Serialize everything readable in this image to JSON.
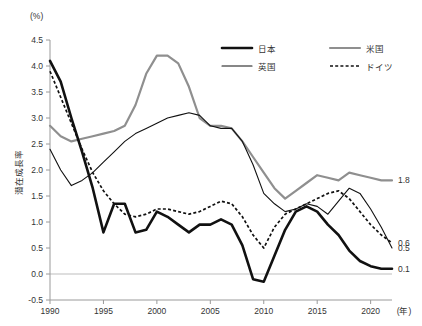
{
  "chart_data": {
    "type": "line",
    "title": "",
    "xlabel": "(年)",
    "ylabel": "潜在成長率",
    "yunit": "(%)",
    "xlim": [
      1990,
      2022
    ],
    "ylim": [
      -0.5,
      4.5
    ],
    "grid": false,
    "legend_position": "top-right",
    "ytick_labels": [
      "4.5",
      "4.0",
      "3.5",
      "3.0",
      "2.5",
      "2.0",
      "1.5",
      "1.0",
      "0.5",
      "0.0",
      "-0.5"
    ],
    "ytick_values": [
      4.5,
      4.0,
      3.5,
      3.0,
      2.5,
      2.0,
      1.5,
      1.0,
      0.5,
      0.0,
      -0.5
    ],
    "xtick_labels": [
      "1990",
      "1995",
      "2000",
      "2005",
      "2010",
      "2015",
      "2020"
    ],
    "xtick_values": [
      1990,
      1995,
      2000,
      2005,
      2010,
      2015,
      2020
    ],
    "x": [
      1990,
      1991,
      1992,
      1993,
      1994,
      1995,
      1996,
      1997,
      1998,
      1999,
      2000,
      2001,
      2002,
      2003,
      2004,
      2005,
      2006,
      2007,
      2008,
      2009,
      2010,
      2011,
      2012,
      2013,
      2014,
      2015,
      2016,
      2017,
      2018,
      2019,
      2020,
      2021,
      2022
    ],
    "series": [
      {
        "name": "日本",
        "key": "japan",
        "color": "#111111",
        "style": "solid-thick",
        "end_label": "0.1",
        "values": [
          4.1,
          3.7,
          3.0,
          2.35,
          1.65,
          0.8,
          1.35,
          1.35,
          0.8,
          0.85,
          1.2,
          1.1,
          0.95,
          0.8,
          0.95,
          0.95,
          1.05,
          0.95,
          0.55,
          -0.1,
          -0.15,
          0.35,
          0.85,
          1.2,
          1.3,
          1.2,
          0.95,
          0.75,
          0.45,
          0.25,
          0.15,
          0.1,
          0.1
        ]
      },
      {
        "name": "英国",
        "key": "uk",
        "color": "#111111",
        "style": "solid-thin",
        "end_label": "0.5",
        "values": [
          2.4,
          2.0,
          1.7,
          1.8,
          1.95,
          2.15,
          2.35,
          2.55,
          2.7,
          2.8,
          2.9,
          3.0,
          3.05,
          3.1,
          3.05,
          2.85,
          2.8,
          2.8,
          2.55,
          2.1,
          1.55,
          1.35,
          1.2,
          1.25,
          1.35,
          1.3,
          1.15,
          1.4,
          1.65,
          1.55,
          1.25,
          0.9,
          0.5
        ]
      },
      {
        "name": "米国",
        "key": "us",
        "color": "#8f8f8f",
        "style": "solid-gray",
        "end_label": "1.8",
        "values": [
          2.85,
          2.65,
          2.55,
          2.6,
          2.65,
          2.7,
          2.75,
          2.85,
          3.25,
          3.85,
          4.2,
          4.2,
          4.05,
          3.6,
          3.0,
          2.85,
          2.85,
          2.8,
          2.55,
          2.25,
          1.95,
          1.65,
          1.45,
          1.6,
          1.75,
          1.9,
          1.85,
          1.8,
          1.95,
          1.9,
          1.85,
          1.8,
          1.8
        ]
      },
      {
        "name": "ドイツ",
        "key": "germany",
        "color": "#111111",
        "style": "dotted",
        "end_label": "0.6",
        "values": [
          3.9,
          3.4,
          2.9,
          2.4,
          1.95,
          1.6,
          1.35,
          1.15,
          1.1,
          1.15,
          1.25,
          1.25,
          1.2,
          1.15,
          1.2,
          1.3,
          1.4,
          1.35,
          1.1,
          0.75,
          0.5,
          0.9,
          1.15,
          1.25,
          1.35,
          1.45,
          1.55,
          1.6,
          1.45,
          1.2,
          0.95,
          0.75,
          0.6
        ]
      }
    ]
  },
  "legend": {
    "items": [
      {
        "label": "日本",
        "key": "japan"
      },
      {
        "label": "米国",
        "key": "us"
      },
      {
        "label": "英国",
        "key": "uk"
      },
      {
        "label": "ドイツ",
        "key": "germany"
      }
    ]
  }
}
